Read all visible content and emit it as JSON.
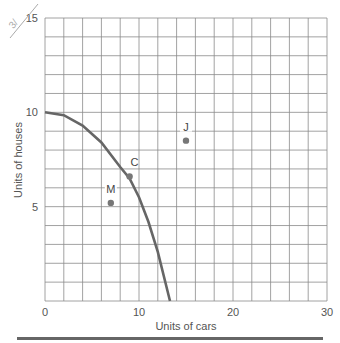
{
  "chart_data": {
    "type": "line",
    "title": "",
    "xlabel": "Units of cars",
    "ylabel": "Units of houses",
    "xlim": [
      0,
      30
    ],
    "ylim": [
      0,
      15
    ],
    "x_ticks": [
      "0",
      "10",
      "20",
      "30"
    ],
    "y_ticks": [
      "0",
      "5",
      "10",
      "15"
    ],
    "grid": true,
    "grid_x_step": 2,
    "grid_y_step": 1,
    "series": [
      {
        "name": "Production possibilities frontier",
        "x": [
          0,
          2,
          4,
          6,
          8,
          9,
          10,
          11,
          12,
          13.3
        ],
        "y": [
          10,
          9.85,
          9.3,
          8.4,
          7.1,
          6.5,
          5.5,
          4.2,
          2.6,
          0
        ]
      }
    ],
    "points": [
      {
        "label": "J",
        "x": 15,
        "y": 8.5
      },
      {
        "label": "C",
        "x": 9,
        "y": 6.6
      },
      {
        "label": "M",
        "x": 7,
        "y": 5.2
      }
    ],
    "colors": {
      "curve": "#666666",
      "grid": "#888888",
      "point": "#777777"
    }
  }
}
